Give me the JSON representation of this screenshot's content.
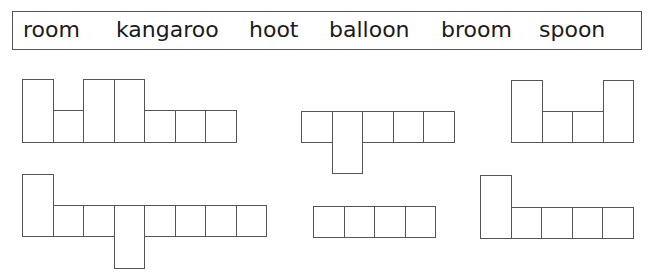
{
  "word_bank": {
    "words": [
      {
        "text": "room",
        "x": 22
      },
      {
        "text": "kangaroo",
        "x": 115
      },
      {
        "text": "hoot",
        "x": 248
      },
      {
        "text": "balloon",
        "x": 328
      },
      {
        "text": "broom",
        "x": 440
      },
      {
        "text": "spoon",
        "x": 538
      }
    ]
  },
  "shapes": [
    {
      "answer_hidden": "balloon",
      "x": 22,
      "unit": 30.5,
      "tall_top": 79,
      "short_top": 110,
      "baseline": 142,
      "desc_bottom": 173,
      "letters": [
        "tall",
        "short",
        "tall",
        "tall",
        "short",
        "short",
        "short"
      ]
    },
    {
      "answer_hidden": "spoon",
      "x": 301,
      "unit": 30.5,
      "tall_top": 80,
      "short_top": 111,
      "baseline": 142,
      "desc_bottom": 173,
      "letters": [
        "short",
        "desc",
        "short",
        "short",
        "short"
      ]
    },
    {
      "answer_hidden": "hoot",
      "x": 511,
      "unit": 30.5,
      "tall_top": 80,
      "short_top": 111,
      "baseline": 142,
      "desc_bottom": 173,
      "letters": [
        "tall",
        "short",
        "short",
        "tall"
      ]
    },
    {
      "answer_hidden": "kangaroo",
      "x": 22,
      "unit": 30.5,
      "tall_top": 174,
      "short_top": 205,
      "baseline": 236,
      "desc_bottom": 268,
      "letters": [
        "tall",
        "short",
        "short",
        "desc",
        "short",
        "short",
        "short",
        "short"
      ]
    },
    {
      "answer_hidden": "room",
      "x": 313,
      "unit": 30.5,
      "tall_top": 175,
      "short_top": 206,
      "baseline": 237,
      "desc_bottom": 268,
      "letters": [
        "short",
        "short",
        "short",
        "short"
      ]
    },
    {
      "answer_hidden": "broom",
      "x": 480,
      "unit": 30.5,
      "tall_top": 175,
      "short_top": 207,
      "baseline": 238,
      "desc_bottom": 269,
      "letters": [
        "tall",
        "short",
        "short",
        "short",
        "short"
      ]
    }
  ]
}
